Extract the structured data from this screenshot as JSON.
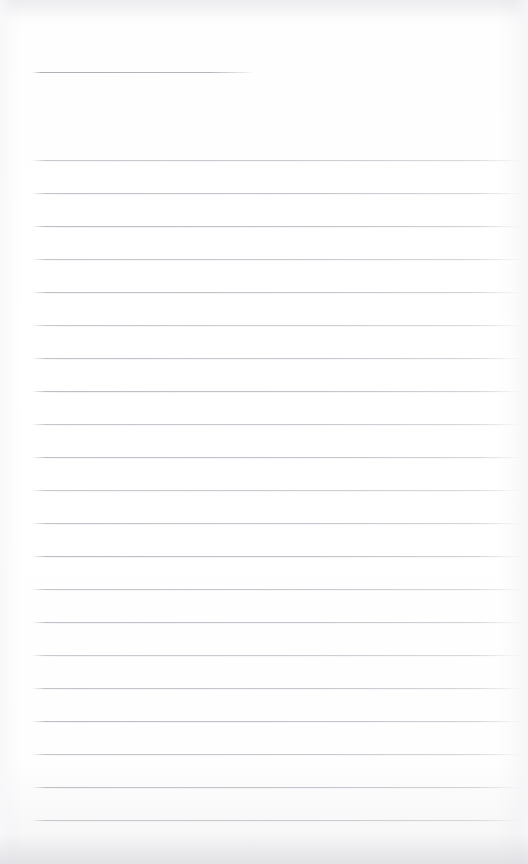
{
  "page": {
    "kind": "scanned-blank-ruled-notebook-page",
    "width": 528,
    "height": 864,
    "background_color": "#fdfdfd",
    "paper_tint_color": "#fefefe",
    "text_content": "",
    "handwriting_present": "no",
    "typed_text_present": "no"
  },
  "header_rule": {
    "label": "",
    "x": 33,
    "y": 72,
    "width": 220,
    "color": "#b0b2b8"
  },
  "ruling": {
    "label": "",
    "line_color": "#babcc3",
    "left_margin_x": 33,
    "right_end_x": 524,
    "first_line_y": 160,
    "line_spacing": 33,
    "line_count": 21,
    "line_y_positions": [
      160,
      193,
      226,
      259,
      292,
      325,
      358,
      391,
      424,
      457,
      490,
      523,
      556,
      589,
      622,
      655,
      688,
      721,
      754,
      787,
      820
    ]
  },
  "scan_artifacts": {
    "label": "",
    "top_band_color": "#dedee2",
    "bottom_band_color": "#d8d8dd",
    "edge_shadow_color": "#f6f6f8"
  }
}
